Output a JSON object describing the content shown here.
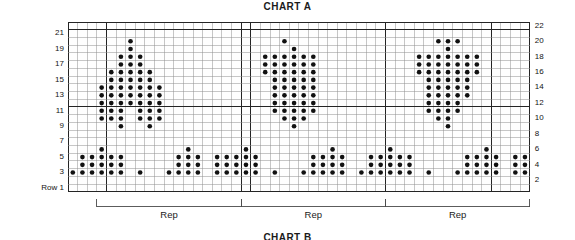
{
  "chart_title": "CHART A",
  "chart_title_next": "CHART B",
  "row_label_prefix": "Row 1",
  "rep_label": "Rep",
  "colors": {
    "dot": "#111111",
    "grid_light": "#8d8d8d",
    "grid_heavy": "#242424",
    "background": "#ffffff",
    "text": "#141414"
  },
  "grid": {
    "columns": 48,
    "rows": 22,
    "cell_width": 9.62,
    "cell_height": 7.72,
    "origin_x": 68,
    "origin_y": 22,
    "heavy_row_lines": [
      11,
      21
    ],
    "heavy_col_lines": [
      4,
      18,
      19,
      33,
      44
    ],
    "bold_col_groups": [
      4,
      18,
      19,
      33,
      44
    ]
  },
  "row_labels_left": [
    {
      "row": 21,
      "text": "21"
    },
    {
      "row": 19,
      "text": "19"
    },
    {
      "row": 17,
      "text": "17"
    },
    {
      "row": 15,
      "text": "15"
    },
    {
      "row": 13,
      "text": "13"
    },
    {
      "row": 11,
      "text": "11"
    },
    {
      "row": 9,
      "text": "9"
    },
    {
      "row": 7,
      "text": "7"
    },
    {
      "row": 5,
      "text": "5"
    },
    {
      "row": 3,
      "text": "3"
    },
    {
      "row": 1,
      "text": "Row 1"
    }
  ],
  "row_labels_right": [
    {
      "row": 22,
      "text": "22"
    },
    {
      "row": 20,
      "text": "20"
    },
    {
      "row": 18,
      "text": "18"
    },
    {
      "row": 16,
      "text": "16"
    },
    {
      "row": 14,
      "text": "14"
    },
    {
      "row": 12,
      "text": "12"
    },
    {
      "row": 10,
      "text": "10"
    },
    {
      "row": 8,
      "text": "8"
    },
    {
      "row": 6,
      "text": "6"
    },
    {
      "row": 4,
      "text": "4"
    },
    {
      "row": 2,
      "text": "2"
    }
  ],
  "rep_brackets": [
    {
      "label": "Rep",
      "col_start": 4,
      "col_end": 18
    },
    {
      "label": "Rep",
      "col_start": 19,
      "col_end": 33
    },
    {
      "label": "Rep",
      "col_start": 34,
      "col_end": 48
    }
  ],
  "chart_data": {
    "type": "heatmap",
    "title": "CHART A",
    "xlabel": "",
    "ylabel": "",
    "legend": [],
    "grid": true,
    "note": "Knitting colorwork chart. Filled cells = patterned stitch (dot symbol). Cells given as 1-indexed [row, column]; row 1 at bottom, column 1 at left. 48 stitches wide, 22 rows tall.",
    "columns": 48,
    "rows": 22,
    "filled_cells_by_row": {
      "22": [],
      "21": [],
      "20": [
        7,
        23,
        39,
        40,
        41
      ],
      "19": [
        7,
        24,
        40
      ],
      "18": [
        6,
        7,
        8,
        21,
        22,
        23,
        24,
        25,
        26,
        37,
        38,
        39,
        40,
        41,
        42,
        43
      ],
      "17": [
        6,
        7,
        8,
        21,
        22,
        23,
        24,
        25,
        26,
        37,
        38,
        39,
        40,
        41,
        42,
        43
      ],
      "16": [
        5,
        6,
        7,
        8,
        9,
        21,
        22,
        23,
        24,
        25,
        26,
        37,
        38,
        39,
        40,
        41,
        42,
        43
      ],
      "15": [
        5,
        6,
        7,
        8,
        9,
        22,
        23,
        24,
        25,
        26,
        38,
        39,
        40,
        41,
        42
      ],
      "14": [
        4,
        5,
        6,
        7,
        8,
        9,
        10,
        22,
        23,
        24,
        25,
        26,
        38,
        39,
        40,
        41,
        42
      ],
      "13": [
        4,
        5,
        6,
        7,
        8,
        9,
        10,
        22,
        23,
        24,
        25,
        26,
        38,
        39,
        40,
        41,
        42
      ],
      "12": [
        4,
        5,
        6,
        7,
        8,
        9,
        10,
        22,
        23,
        24,
        25,
        26,
        38,
        39,
        40,
        41
      ],
      "11": [
        4,
        5,
        6,
        8,
        9,
        10,
        22,
        23,
        24,
        25,
        26,
        38,
        39,
        40,
        41
      ],
      "10": [
        4,
        5,
        6,
        8,
        9,
        10,
        23,
        24,
        25,
        39,
        40
      ],
      "9": [
        6,
        9,
        24,
        40
      ],
      "8": [],
      "7": [],
      "6": [
        4,
        13,
        19,
        28,
        34,
        44
      ],
      "5": [
        2,
        3,
        4,
        5,
        6,
        12,
        13,
        14,
        16,
        17,
        18,
        19,
        20,
        26,
        27,
        28,
        29,
        32,
        33,
        34,
        35,
        36,
        42,
        43,
        44,
        45,
        47,
        48
      ],
      "4": [
        2,
        3,
        4,
        5,
        6,
        12,
        13,
        14,
        16,
        17,
        18,
        19,
        20,
        26,
        27,
        28,
        29,
        32,
        33,
        34,
        35,
        36,
        42,
        43,
        44,
        45,
        47,
        48
      ],
      "3": [
        1,
        2,
        3,
        4,
        5,
        6,
        8,
        11,
        12,
        13,
        14,
        16,
        17,
        18,
        19,
        20,
        22,
        25,
        26,
        27,
        28,
        29,
        31,
        32,
        33,
        34,
        35,
        36,
        38,
        41,
        42,
        43,
        44,
        45,
        47,
        48
      ],
      "2": [],
      "1": []
    }
  }
}
